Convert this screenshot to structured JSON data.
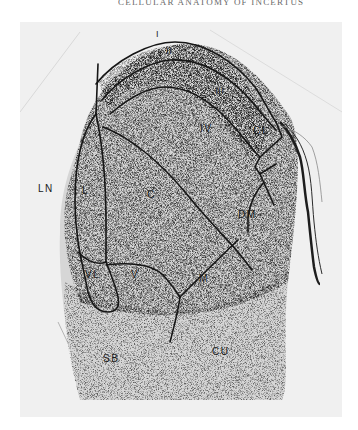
{
  "page": {
    "running_header": "CELLULAR ANATOMY OF INCERTUS"
  },
  "figure": {
    "type": "labeled histological section",
    "background_color": "#eeeeee",
    "stain_color": "#3a3a3a",
    "outline_color": "#161616",
    "region_labels": [
      {
        "id": "I",
        "text": "I"
      },
      {
        "id": "II",
        "text": "II"
      },
      {
        "id": "III",
        "text": "III"
      },
      {
        "id": "IV",
        "text": "IV"
      },
      {
        "id": "CL",
        "text": "CL"
      },
      {
        "id": "LN",
        "text": "LN"
      },
      {
        "id": "L",
        "text": "L"
      },
      {
        "id": "C",
        "text": "C"
      },
      {
        "id": "DM",
        "text": "DM"
      },
      {
        "id": "VL",
        "text": "VL"
      },
      {
        "id": "V",
        "text": "V"
      },
      {
        "id": "M",
        "text": "M"
      },
      {
        "id": "SB",
        "text": "SB"
      },
      {
        "id": "CU",
        "text": "CU"
      }
    ]
  }
}
